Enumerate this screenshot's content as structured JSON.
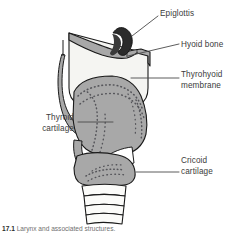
{
  "figure": {
    "view": "lateral / cut-away sagittal section of the larynx",
    "background_color": "#ffffff",
    "outline_color": "#1a1a1a",
    "colors": {
      "cartilage_gray": "#a8a8a8",
      "membrane_white": "#f5f5f2",
      "epiglottis_dark": "#2b2b2b",
      "stipple": "#55555a",
      "label_text": "#3b3b3b",
      "leader_line": "#4a4a4a",
      "trachea_ring_fill": "#fbfbf9"
    }
  },
  "labels": [
    {
      "id": "epiglottis",
      "text": "Epiglottis",
      "side": "right",
      "lines": [
        "Epiglottis"
      ],
      "leader": "diagonal"
    },
    {
      "id": "hyoid-bone",
      "text": "Hyoid bone",
      "side": "right",
      "lines": [
        "Hyoid bone"
      ],
      "leader": "diagonal"
    },
    {
      "id": "thyrohyoid-membrane",
      "text": "Thyrohyoid membrane",
      "side": "right",
      "lines": [
        "Thyrohyoid",
        "membrane"
      ],
      "leader": "horizontal"
    },
    {
      "id": "thyroid-cartilage",
      "text": "Thyroid cartilage",
      "side": "left",
      "lines": [
        "Thyroid",
        "cartilage"
      ],
      "leader": "horizontal"
    },
    {
      "id": "cricoid-cartilage",
      "text": "Cricoid cartilage",
      "side": "right",
      "lines": [
        "Cricoid",
        "cartilage"
      ],
      "leader": "horizontal"
    }
  ],
  "label_lines": {
    "epiglottis_1": "Epiglottis",
    "hyoid_1": "Hyoid bone",
    "thyrohyoid_1": "Thyrohyoid",
    "thyrohyoid_2": "membrane",
    "thyroid_1": "Thyroid",
    "thyroid_2": "cartilage",
    "cricoid_1": "Cricoid",
    "cricoid_2": "cartilage"
  },
  "structures": [
    {
      "id": "epiglottis",
      "name": "Epiglottis",
      "fill": "dark"
    },
    {
      "id": "hyoid-bone",
      "name": "Hyoid bone",
      "fill": "gray"
    },
    {
      "id": "thyrohyoid-membrane",
      "name": "Thyrohyoid membrane",
      "fill": "white"
    },
    {
      "id": "thyroid-cartilage",
      "name": "Thyroid cartilage",
      "fill": "gray-stippled"
    },
    {
      "id": "cricoid-cartilage",
      "name": "Cricoid cartilage",
      "fill": "gray-stippled"
    },
    {
      "id": "superior-horn",
      "name": "Superior horn of thyroid cartilage",
      "fill": "gray"
    },
    {
      "id": "trachea",
      "name": "Tracheal rings",
      "fill": "white",
      "ring_count": 4
    }
  ],
  "caption": {
    "prefix": "17.1",
    "text": "Larynx and associated structures."
  }
}
